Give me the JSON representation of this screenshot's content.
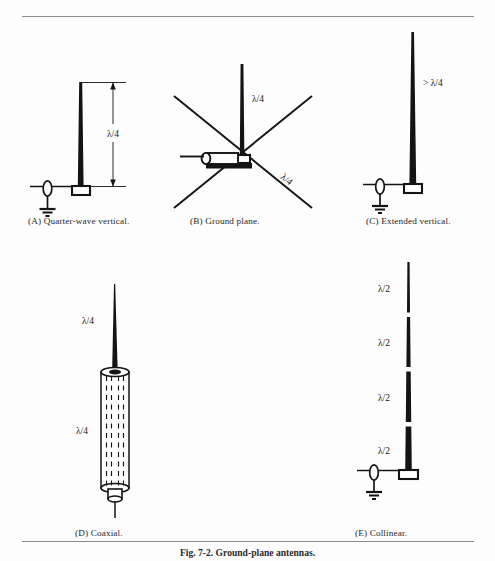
{
  "figure": {
    "caption": "Fig. 7-2. Ground-plane antennas.",
    "rules": {
      "top": true,
      "bottom": true
    }
  },
  "panels": [
    {
      "id": "a",
      "caption": "(A) Quarter-wave vertical.",
      "dimension_label": "λ/4",
      "has_dimension_arrow": true,
      "has_ground_symbol": true,
      "has_feed_insulator": true,
      "radiator": "single tapered vertical whip",
      "mast_height_label": "λ/4"
    },
    {
      "id": "b",
      "caption": "(B) Ground plane.",
      "vertical_label": "λ/4",
      "radial_label": "λ/4",
      "radial_count": 4,
      "has_coax_connector": true,
      "radiator": "vertical whip with four sloping radials"
    },
    {
      "id": "c",
      "caption": "(C) Extended vertical.",
      "dimension_label": "> λ/4",
      "has_ground_symbol": true,
      "has_feed_insulator": true,
      "radiator": "tall tapered vertical whip"
    },
    {
      "id": "d",
      "caption": "(D) Coaxial.",
      "upper_label": "λ/4",
      "lower_label": "λ/4",
      "has_sleeve": true,
      "has_connector": true,
      "radiator": "whip above quarter-wave coaxial sleeve"
    },
    {
      "id": "e",
      "caption": "(E) Collinear.",
      "segment_labels": [
        "λ/2",
        "λ/2",
        "λ/2",
        "λ/2"
      ],
      "segment_count": 4,
      "has_ground_symbol": true,
      "has_feed_insulator": true,
      "radiator": "four stacked half-wave sections with insulating gaps"
    }
  ],
  "colors": {
    "ink": "#141414",
    "rule": "#8d8d8d",
    "paper": "#fdfdfd",
    "caption": "#262626"
  }
}
